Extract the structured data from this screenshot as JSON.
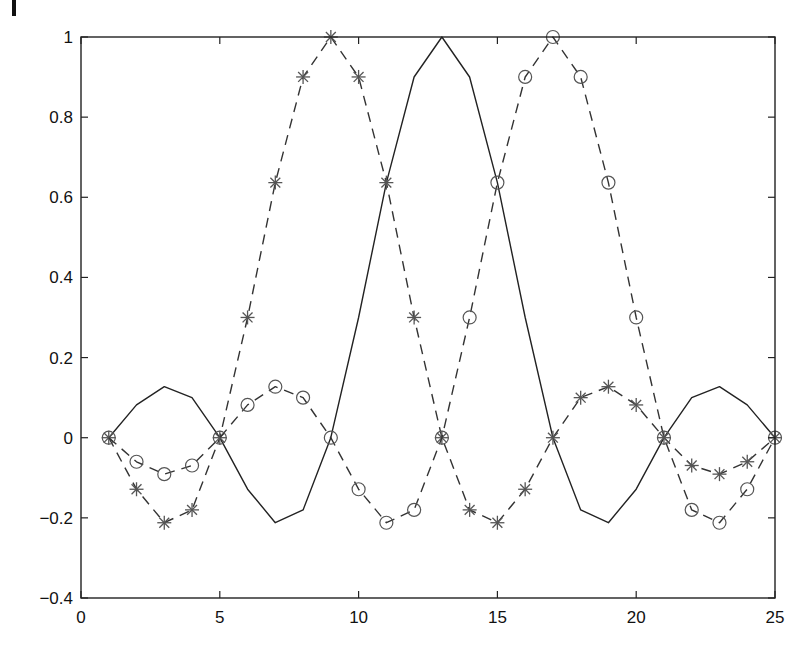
{
  "chart_data": {
    "type": "line",
    "title": "",
    "xlabel": "",
    "ylabel": "",
    "xlim": [
      0,
      25
    ],
    "ylim": [
      -0.4,
      1
    ],
    "grid": false,
    "legend": null,
    "x_ticks": [
      0,
      5,
      10,
      15,
      20,
      25
    ],
    "x_tick_labels": [
      "0",
      "5",
      "10",
      "15",
      "20",
      "25"
    ],
    "y_ticks": [
      -0.4,
      -0.2,
      0,
      0.2,
      0.4,
      0.6,
      0.8,
      1
    ],
    "y_tick_labels": [
      "-0.4",
      "-0.2",
      "0",
      "0.2",
      "0.4",
      "0.6",
      "0.8",
      "1"
    ],
    "x": [
      1,
      2,
      3,
      4,
      5,
      6,
      7,
      8,
      9,
      10,
      11,
      12,
      13,
      14,
      15,
      16,
      17,
      18,
      19,
      20,
      21,
      22,
      23,
      24,
      25
    ],
    "series": [
      {
        "name": "solid",
        "line_style": "solid",
        "marker": "none",
        "color": "#222222",
        "values": [
          0,
          0.0818,
          0.1273,
          0.1,
          0,
          -0.1286,
          -0.2122,
          -0.1801,
          0,
          0.3001,
          0.6366,
          0.9003,
          1,
          0.9003,
          0.6366,
          0.3001,
          0,
          -0.1801,
          -0.2122,
          -0.1286,
          0,
          0.1,
          0.1273,
          0.0818,
          0
        ]
      },
      {
        "name": "stars",
        "line_style": "dashed",
        "marker": "asterisk",
        "color": "#333333",
        "marker_color": "#555555",
        "values": [
          0,
          -0.1286,
          -0.2122,
          -0.1801,
          0,
          0.3001,
          0.6366,
          0.9003,
          1,
          0.9003,
          0.6366,
          0.3001,
          0,
          -0.1801,
          -0.2122,
          -0.1286,
          0,
          0.1,
          0.1273,
          0.0818,
          0,
          -0.0693,
          -0.0909,
          -0.06,
          0
        ]
      },
      {
        "name": "circles",
        "line_style": "dashed",
        "marker": "circle",
        "color": "#333333",
        "marker_color": "#555555",
        "values": [
          0,
          -0.06,
          -0.0909,
          -0.0693,
          0,
          0.0818,
          0.1273,
          0.1,
          0,
          -0.1286,
          -0.2122,
          -0.1801,
          0,
          0.3001,
          0.6366,
          0.9003,
          1,
          0.9003,
          0.6366,
          0.3001,
          0,
          -0.1801,
          -0.2122,
          -0.1286,
          0
        ]
      }
    ]
  },
  "layout": {
    "plot_left": 81,
    "plot_right": 775,
    "plot_top": 37,
    "plot_bottom": 598
  }
}
